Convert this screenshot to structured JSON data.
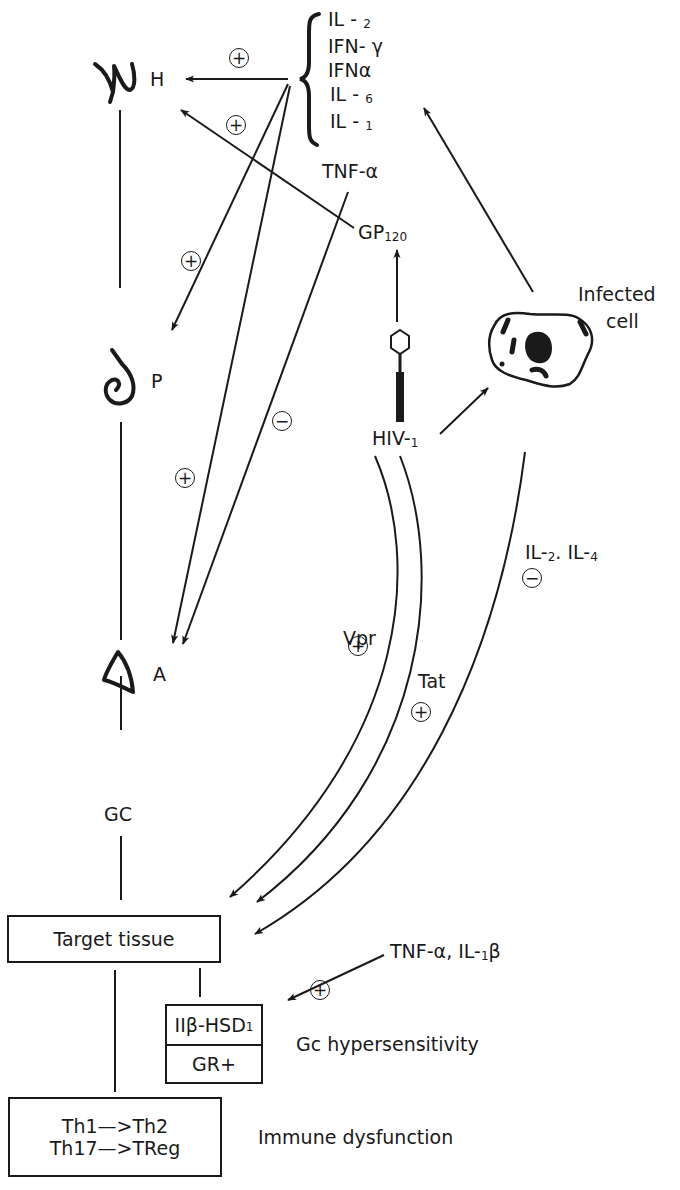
{
  "glands": {
    "hypothalamus": {
      "label": "H"
    },
    "pituitary": {
      "label": "P"
    },
    "adrenal": {
      "label": "A"
    }
  },
  "hormone": {
    "label": "GC"
  },
  "cytokines": {
    "items": [
      {
        "main": "IL - ",
        "sub": "2"
      },
      {
        "main": "IFN- γ",
        "sub": ""
      },
      {
        "main": "IFNα",
        "sub": ""
      },
      {
        "main": "IL - ",
        "sub": "6"
      },
      {
        "main": "IL - ",
        "sub": "1"
      }
    ],
    "tnf": "TNF-α"
  },
  "virus": {
    "gp120_main": "GP",
    "gp120_sub": "120",
    "hiv_main": "HIV-",
    "hiv_sub": "1"
  },
  "infected_cell": {
    "line1": "Infected",
    "line2": "cell"
  },
  "pathways": {
    "vpr": "Vpr",
    "tat": "Tat",
    "il_main1": "IL-",
    "il_sub1": "2",
    "il_sep": ". IL-",
    "il_sub2": "4"
  },
  "signs": {
    "plus": "+",
    "minus": "−"
  },
  "boxes": {
    "target_tissue": "Target tissue",
    "hsd_main": "IIβ-HSD",
    "hsd_sub": "1",
    "gr": "GR+",
    "th_line1": "Th1—>Th2",
    "th_line2": "Th17—>TReg"
  },
  "side_labels": {
    "tnf_il_main": "TNF-α, IL-",
    "tnf_il_sub": "1",
    "tnf_il_end": "β",
    "gc_hyper": "Gc hypersensitivity",
    "immune": "Immune dysfunction"
  },
  "colors": {
    "ink": "#1a1a1a",
    "background": "#ffffff"
  }
}
